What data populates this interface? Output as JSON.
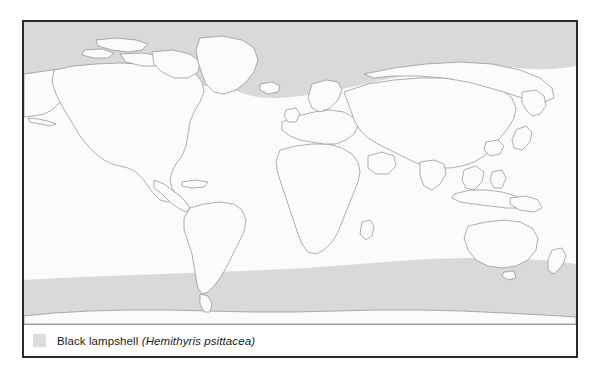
{
  "figure": {
    "type": "species-distribution-map",
    "projection": "world-equirectangular",
    "background_color": "#fbfbfb",
    "frame_color": "#2b2b2b"
  },
  "legend": {
    "swatch_color": "#dcdcdc",
    "common_name": "Black lampshell",
    "scientific_name": "(Hemithyris psittacea)"
  },
  "map": {
    "range_color": "#d9d9d9",
    "land_fill": "#fbfbfb",
    "coastline_color": "#8c8c8c",
    "regions": [
      {
        "name": "arctic-range-band",
        "description": "Shaded distribution band across Arctic Ocean and northern North Atlantic / North Pacific"
      },
      {
        "name": "southern-ocean-band",
        "description": "Shaded band across the Southern Ocean around Antarctica"
      }
    ],
    "landmasses": [
      "North America",
      "Greenland",
      "Iceland",
      "South America",
      "Africa",
      "Europe",
      "Asia",
      "Australia",
      "New Zealand",
      "Antarctica",
      "Madagascar",
      "Japan",
      "Indonesia",
      "Philippines",
      "British Isles"
    ]
  }
}
